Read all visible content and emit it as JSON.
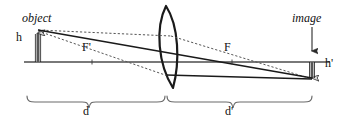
{
  "diagram": {
    "labels": {
      "object": "object",
      "image": "image",
      "object_height": "h",
      "image_height": "h'",
      "focal_left": "F'",
      "focal_right": "F",
      "object_distance": "d",
      "image_distance": "d'"
    },
    "colors": {
      "stroke": "#1a1a1a",
      "axis": "#4d4d4d",
      "dotted": "#555555",
      "background": "#ffffff",
      "arrow_fill": "#d9d9d9",
      "brace": "#6b6b6b"
    },
    "geometry": {
      "axis_y": 62,
      "lens_center_x": 166,
      "lens_top_y": 6,
      "lens_bottom_y": 88,
      "object_x": 38,
      "object_top_y": 30,
      "image_x": 312,
      "image_bottom_y": 82,
      "focal_left_x": 92,
      "focal_right_x": 232,
      "brace_d_from": 27,
      "brace_d_to": 165,
      "brace_dp_from": 167,
      "brace_dp_to": 312
    },
    "elements": {
      "ray_parallel": "parallel-ray",
      "ray_chief": "chief-ray-through-center",
      "ray_focal": "ray-through-front-focus",
      "axis": "optical-axis",
      "lens": "biconvex-lens"
    }
  }
}
